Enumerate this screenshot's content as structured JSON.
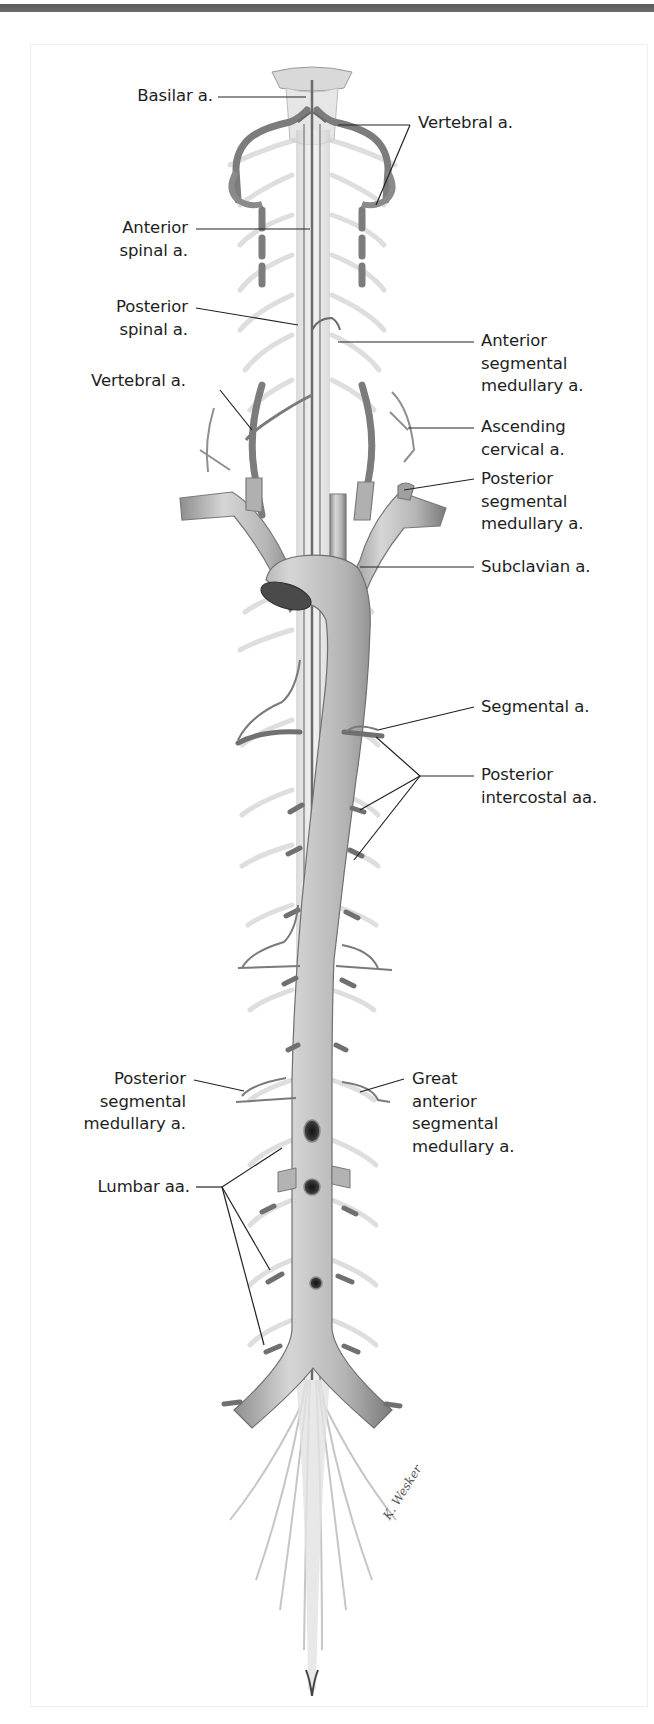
{
  "figure": {
    "type": "anatomical-illustration",
    "colors": {
      "top_bar": "#606060",
      "frame_border": "#eeeeee",
      "vessel_fill": "#bdbdbd",
      "vessel_dark": "#6e6e6e",
      "nerve_fill": "#e4e4e4",
      "label_text": "#1e1e1e",
      "leader_line": "#222222"
    },
    "signature": "K. Wesker"
  },
  "labels": {
    "basilar": "Basilar a.",
    "vertebral_top": "Vertebral a.",
    "anterior_spinal": "Anterior\nspinal a.",
    "posterior_spinal": "Posterior\nspinal a.",
    "anterior_segmental_medullary": "Anterior\nsegmental\nmedullary a.",
    "vertebral_left": "Vertebral a.",
    "ascending_cervical": "Ascending\ncervical a.",
    "posterior_segmental_medullary_top": "Posterior\nsegmental\nmedullary a.",
    "subclavian": "Subclavian a.",
    "segmental": "Segmental a.",
    "posterior_intercostal": "Posterior\nintercostal aa.",
    "posterior_segmental_medullary_bottom": "Posterior\nsegmental\nmedullary a.",
    "great_anterior_segmental_medullary": "Great\nanterior\nsegmental\nmedullary a.",
    "lumbar": "Lumbar aa."
  }
}
